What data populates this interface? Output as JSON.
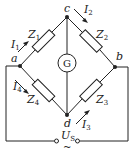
{
  "diagram": {
    "type": "bridge circuit",
    "nodes": {
      "a": "a",
      "b": "b",
      "c": "c",
      "d": "d"
    },
    "impedances": [
      {
        "name": "Z",
        "sub": "1"
      },
      {
        "name": "Z",
        "sub": "2"
      },
      {
        "name": "Z",
        "sub": "3"
      },
      {
        "name": "Z",
        "sub": "4"
      }
    ],
    "currents": [
      {
        "name": "I",
        "sub": "1"
      },
      {
        "name": "I",
        "sub": "2"
      },
      {
        "name": "I",
        "sub": "3"
      },
      {
        "name": "I",
        "sub": "4"
      }
    ],
    "galvanometer": "G",
    "source": {
      "name": "U",
      "sub": "S",
      "symbol": "~"
    },
    "colors": {
      "line": "#222222",
      "background": "#ffffff"
    }
  }
}
